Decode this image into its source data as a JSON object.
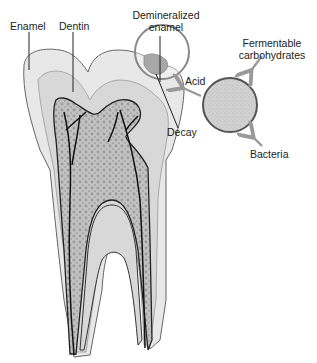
{
  "diagram": {
    "labels": {
      "enamel": "Enamel",
      "dentin": "Dentin",
      "demineralized_line1": "Demineralized",
      "demineralized_line2": "enamel",
      "decay": "Decay",
      "acid": "Acid",
      "fermentable_line1": "Fermentable",
      "fermentable_line2": "carbohydrates",
      "bacteria": "Bacteria"
    },
    "colors": {
      "outline": "#555555",
      "enamel_fill": "#e6e6e6",
      "dentin_fill": "#d6d6d6",
      "pulp_fill": "#b9b9b9",
      "nerve": "#111111",
      "arrow": "#999999",
      "bacteria_fill": "#cfcfcf"
    }
  }
}
